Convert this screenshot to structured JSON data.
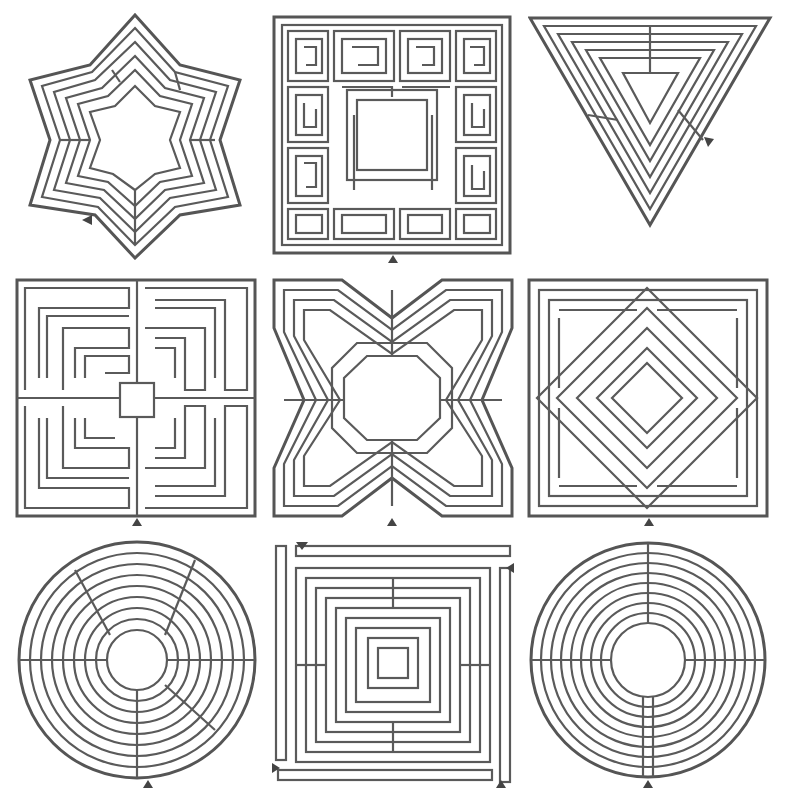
{
  "figure": {
    "type": "labyrinth-collection",
    "background": "#ffffff",
    "line_color": "#555555",
    "grid": {
      "rows": 3,
      "cols": 3
    },
    "mazes": [
      {
        "id": "star",
        "shape": "six-pointed star",
        "center": "hexagram",
        "entrance": "bottom-left arrow"
      },
      {
        "id": "greek-key-square",
        "shape": "square",
        "center": "square",
        "entrance": "bottom arrow"
      },
      {
        "id": "triangle",
        "shape": "inverted triangle",
        "center": "triangle",
        "entrance": "right arrow"
      },
      {
        "id": "square-quadrants",
        "shape": "square",
        "center": "small square",
        "entrance": "bottom arrow"
      },
      {
        "id": "cross-octagon",
        "shape": "notched square",
        "center": "octagon",
        "entrance": "bottom arrow"
      },
      {
        "id": "diamond-in-square",
        "shape": "square",
        "center": "diamond",
        "entrance": "bottom arrow"
      },
      {
        "id": "circle-segmented",
        "shape": "circle",
        "center": "circle",
        "entrance": "bottom arrow"
      },
      {
        "id": "square-spiral",
        "shape": "square with outer bars",
        "center": "small square",
        "entrance": "four corner arrows"
      },
      {
        "id": "circle-chartres",
        "shape": "circle",
        "center": "circle",
        "entrance": "bottom arrow"
      }
    ]
  }
}
